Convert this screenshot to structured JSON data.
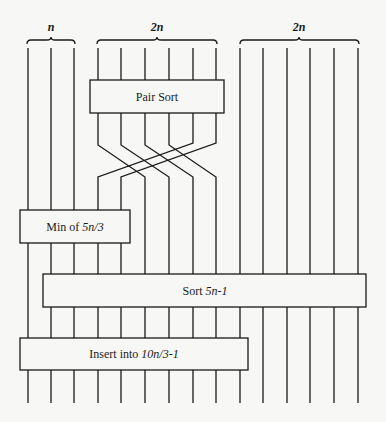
{
  "diagram": {
    "type": "sorting-network",
    "stroke_color": "#1a1a1a",
    "box_fill": "#f7f7f5",
    "groups": [
      {
        "label": "n",
        "x1": 27,
        "x2": 75
      },
      {
        "label": "2n",
        "x1": 97,
        "x2": 217
      },
      {
        "label": "2n",
        "x1": 240,
        "x2": 359
      }
    ],
    "boxes": {
      "pair_sort": {
        "label": "Pair Sort",
        "var": ""
      },
      "min": {
        "label": "Min of ",
        "var": "5n/3"
      },
      "sort": {
        "label": "Sort ",
        "var": "5n-1"
      },
      "insert": {
        "label": "Insert into ",
        "var": "10n/3-1"
      }
    }
  }
}
